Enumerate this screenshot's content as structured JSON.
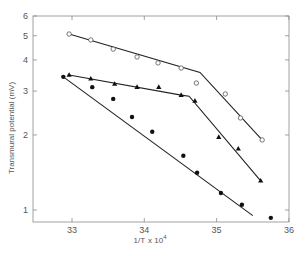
{
  "chart_data": {
    "type": "scatter",
    "title": "",
    "xlabel": "1/T x 10^4",
    "xlabel_main": "1/T",
    "xlabel_mult": "x 10",
    "xlabel_exp": "4",
    "ylabel": "Transmural potential (mV)",
    "xlim": [
      32.5,
      36
    ],
    "ylim": [
      0.85,
      6
    ],
    "yscale": "log",
    "grid": false,
    "legend": "none",
    "x_ticks": [
      33,
      34,
      35,
      36
    ],
    "x_tick_labels": [
      "33",
      "34",
      "35",
      "36"
    ],
    "y_ticks": [
      1,
      2,
      3,
      4,
      5,
      6
    ],
    "y_tick_labels": [
      "1",
      "2",
      "3",
      "4",
      "5",
      "6"
    ],
    "series": [
      {
        "name": "open circles",
        "marker": "open-circle",
        "x": [
          32.96,
          33.26,
          33.57,
          33.9,
          34.19,
          34.51,
          34.72,
          35.12,
          35.33,
          35.63
        ],
        "y": [
          5.08,
          4.81,
          4.42,
          4.11,
          3.89,
          3.71,
          3.23,
          2.92,
          2.34,
          1.91
        ],
        "fit_line": [
          [
            32.96,
            5.08
          ],
          [
            34.77,
            3.56
          ],
          [
            35.63,
            1.91
          ]
        ]
      },
      {
        "name": "filled triangles",
        "marker": "filled-triangle",
        "x": [
          32.96,
          33.26,
          33.59,
          33.9,
          34.2,
          34.51,
          34.7,
          35.03,
          35.3,
          35.61
        ],
        "y": [
          3.48,
          3.36,
          3.2,
          3.11,
          3.11,
          2.89,
          2.74,
          1.96,
          1.76,
          1.31
        ],
        "fit_line": [
          [
            32.96,
            3.48
          ],
          [
            34.51,
            2.89
          ],
          [
            34.62,
            2.86
          ],
          [
            35.61,
            1.31
          ]
        ]
      },
      {
        "name": "filled circles",
        "marker": "filled-circle",
        "x": [
          32.88,
          33.28,
          33.57,
          33.83,
          34.11,
          34.54,
          34.73,
          35.06,
          35.35,
          35.75
        ],
        "y": [
          3.42,
          3.11,
          2.79,
          2.36,
          2.06,
          1.65,
          1.41,
          1.17,
          1.05,
          0.93
        ],
        "fit_line": [
          [
            32.88,
            3.42
          ],
          [
            35.5,
            0.95
          ]
        ]
      }
    ]
  }
}
